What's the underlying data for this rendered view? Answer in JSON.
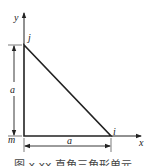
{
  "diagram": {
    "axes": {
      "x_label": "x",
      "y_label": "y"
    },
    "nodes": [
      {
        "id": "j",
        "label": "j"
      },
      {
        "id": "m",
        "label": "m"
      },
      {
        "id": "i",
        "label": "i"
      }
    ],
    "dimensions": {
      "vertical": "a",
      "horizontal": "a"
    },
    "caption": "图 x.xx   直角三角形单元",
    "colors": {
      "line": "#222222",
      "background": "#ffffff"
    }
  }
}
